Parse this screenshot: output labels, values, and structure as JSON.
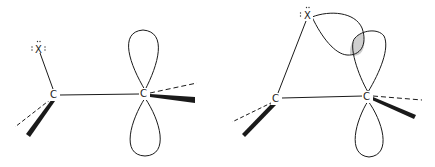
{
  "figure": {
    "left_panel": {
      "description": "Carbocation adjacent to halogen with empty p orbital (open)",
      "atoms": {
        "x_label": "X",
        "x_lone_pairs": ":X:",
        "c1_label": "C",
        "c2_label": "C"
      }
    },
    "right_panel": {
      "description": "Bridged halonium: X lone pair overlaps with empty p orbital (shaded overlap)",
      "atoms": {
        "x_label": "X",
        "x_lone_pairs": ":X",
        "c1_label": "C",
        "c2_label": "C"
      },
      "overlap_fill": "#cfcfcf"
    },
    "colors": {
      "line": "#1a1a1a",
      "background": "#ffffff"
    }
  }
}
